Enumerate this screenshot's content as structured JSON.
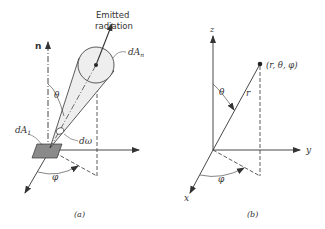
{
  "figure": {
    "panel_a": {
      "caption": "(a)",
      "labels": {
        "normal": "n",
        "emitted_line1": "Emitted",
        "emitted_line2": "radiation",
        "dAn": "dA",
        "dAn_sub": "n",
        "theta": "θ",
        "domega": "dω",
        "dA1": "dA",
        "dA1_sub": "1",
        "phi": "φ"
      }
    },
    "panel_b": {
      "caption": "(b)",
      "labels": {
        "z": "z",
        "y": "y",
        "x": "x",
        "theta": "θ",
        "r": "r",
        "phi": "φ",
        "point": "(r, θ, φ)"
      }
    },
    "colors": {
      "line": "#333333",
      "cone_fill": "#eeeeee",
      "patch_fill": "#8a8a8a"
    }
  }
}
